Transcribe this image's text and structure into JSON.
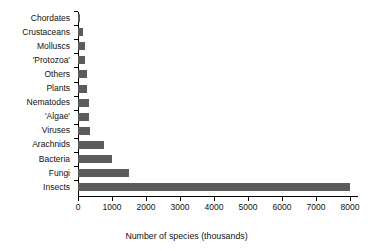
{
  "chart_data": {
    "type": "bar",
    "orientation": "horizontal",
    "title": "",
    "xlabel": "Number of species (thousands)",
    "ylabel": "",
    "xlim": [
      0,
      8000
    ],
    "xticks": [
      0,
      1000,
      2000,
      3000,
      4000,
      5000,
      6000,
      7000,
      8000
    ],
    "xtick_labels": [
      "0",
      "1000",
      "2000",
      "3000",
      "4000",
      "5000",
      "6000",
      "7000",
      "8000"
    ],
    "grid": false,
    "legend": null,
    "bar_color": "#5c5c5c",
    "axis_color": "#000000",
    "categories": [
      "Chordates",
      "Crustaceans",
      "Molluscs",
      "'Protozoa'",
      "Others",
      "Plants",
      "Nematodes",
      "'Algae'",
      "Viruses",
      "Arachnids",
      "Bacteria",
      "Fungi",
      "Insects"
    ],
    "values": [
      45,
      150,
      200,
      200,
      250,
      270,
      320,
      330,
      340,
      750,
      1000,
      1500,
      8000
    ],
    "series": [
      {
        "name": "Number of species (thousands)",
        "values": [
          45,
          150,
          200,
          200,
          250,
          270,
          320,
          330,
          340,
          750,
          1000,
          1500,
          8000
        ]
      }
    ]
  }
}
